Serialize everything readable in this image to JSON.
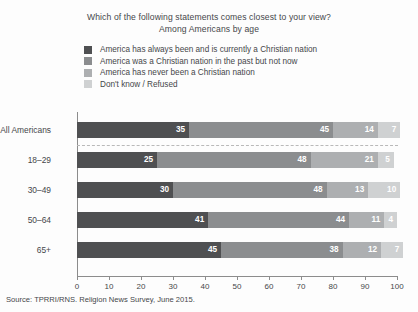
{
  "title": "Which of the following statements comes closest to your view?",
  "subtitle": "Among Americans by age",
  "source": "Source: TPRRI/RNS. Religion News Survey, June 2015.",
  "legend": [
    {
      "label": "America has always been and is currently a Christian nation",
      "color": "#4f5052"
    },
    {
      "label": "America was a Christian nation in the past but not now",
      "color": "#8b8d8f"
    },
    {
      "label": "America has never been a Christian nation",
      "color": "#adafb1"
    },
    {
      "label": "Don't know / Refused",
      "color": "#cfd1d2"
    }
  ],
  "chart_data": {
    "type": "bar",
    "orientation": "horizontal",
    "stacked": true,
    "title": "Which of the following statements comes closest to your view?",
    "subtitle": "Among Americans by age",
    "xlabel": "",
    "ylabel": "",
    "xlim": [
      0,
      100
    ],
    "xticks": [
      0,
      10,
      20,
      30,
      40,
      50,
      60,
      70,
      80,
      90,
      100
    ],
    "grid": false,
    "legend_position": "top-left",
    "categories": [
      "All Americans",
      "18–29",
      "30–49",
      "50–64",
      "65+"
    ],
    "series": [
      {
        "name": "America has always been and is currently a Christian nation",
        "color": "#4f5052",
        "values": [
          35,
          25,
          30,
          41,
          45
        ]
      },
      {
        "name": "America was a Christian nation in the past but not now",
        "color": "#8b8d8f",
        "values": [
          45,
          48,
          48,
          44,
          38
        ]
      },
      {
        "name": "America has never been a Christian nation",
        "color": "#adafb1",
        "values": [
          14,
          21,
          13,
          11,
          12
        ]
      },
      {
        "name": "Don't know / Refused",
        "color": "#cfd1d2",
        "values": [
          7,
          5,
          10,
          4,
          7
        ]
      }
    ],
    "annotations": {
      "divider_after_category": "All Americans"
    }
  }
}
